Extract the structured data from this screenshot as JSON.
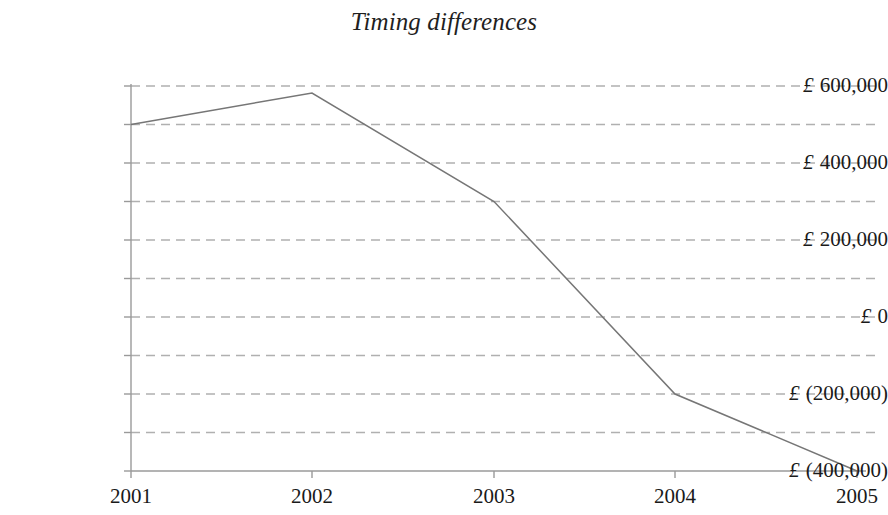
{
  "chart_data": {
    "type": "line",
    "title": "Timing differences",
    "xlabel": "",
    "ylabel": "",
    "categories": [
      "2001",
      "2002",
      "2003",
      "2004",
      "2005"
    ],
    "x": [
      2001,
      2002,
      2003,
      2004,
      2005
    ],
    "series": [
      {
        "name": "Timing differences",
        "values": [
          500000,
          575000,
          300000,
          -200000,
          -400000
        ]
      }
    ],
    "ylim": [
      -400000,
      600000
    ],
    "y_major_step": 200000,
    "y_minor_step": 100000,
    "y_tick_labels": [
      "£ 600,000",
      "£ 400,000",
      "£ 200,000",
      "£ 0",
      "£ (200,000)",
      "£ (400,000)"
    ],
    "y_tick_values": [
      600000,
      400000,
      200000,
      0,
      -200000,
      -400000
    ],
    "x_tick_labels": [
      "2001",
      "2002",
      "2003",
      "2004",
      "2005"
    ],
    "grid": "horizontal-dashed",
    "legend": "none",
    "currency_symbol": "£",
    "colors": {
      "line": "#767676",
      "grid": "#b0b0b0",
      "axis": "#9a9a9a",
      "text": "#1a1a1a",
      "background": "#ffffff"
    }
  }
}
